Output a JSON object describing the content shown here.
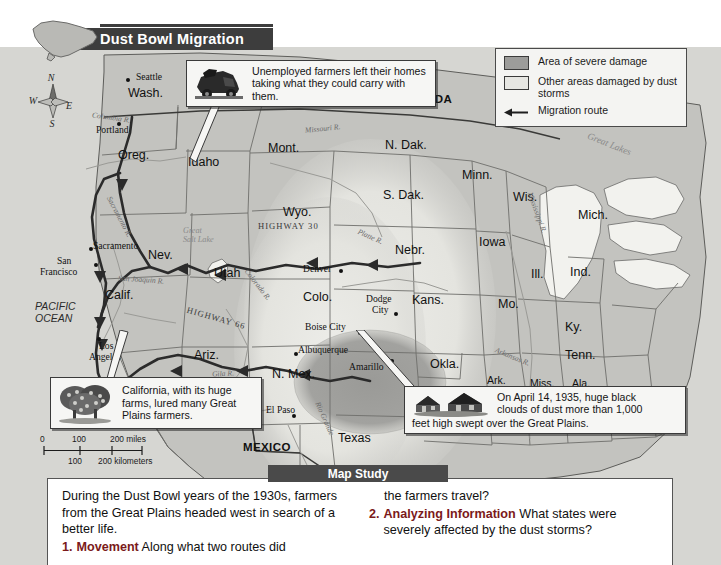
{
  "title": {
    "text": "Dust Bowl Migration",
    "icon": "usa-outline-icon"
  },
  "compass": {
    "north": "N",
    "east": "E",
    "south": "S",
    "west": "W"
  },
  "legend": {
    "items": [
      {
        "swatch": "severe",
        "label": "Area of severe damage"
      },
      {
        "swatch": "other",
        "label": "Other areas damaged by dust storms"
      },
      {
        "swatch": "arrow",
        "label": "Migration route"
      }
    ]
  },
  "callouts": [
    {
      "id": "farmers",
      "icon": "loaded-truck-icon",
      "text": "Unemployed farmers left their homes taking what they could carry with them."
    },
    {
      "id": "california",
      "icon": "orchard-trees-icon",
      "text": "California, with its huge farms, lured many Great Plains farmers."
    },
    {
      "id": "dust",
      "icon": "farm-houses-icon",
      "text_line1": "On April 14, 1935, huge black",
      "text_line2": "clouds of dust more than 1,000",
      "text_line3": "feet high swept over the Great Plains."
    }
  ],
  "scale": {
    "miles": "0        100       200 miles",
    "miles_zero": "0",
    "miles_100": "100",
    "miles_200": "200 miles",
    "km_100": "100",
    "km_200": "200 kilometers"
  },
  "map": {
    "countries": [
      {
        "name": "CANADA",
        "x": 400,
        "y": 93
      },
      {
        "name": "MEXICO",
        "x": 243,
        "y": 441
      }
    ],
    "ocean": {
      "line1": "PACIFIC",
      "line2": "OCEAN",
      "x": 35,
      "y": 300
    },
    "states": [
      {
        "name": "Wash.",
        "x": 128,
        "y": 86,
        "size": "state"
      },
      {
        "name": "Oreg.",
        "x": 118,
        "y": 148,
        "size": "state"
      },
      {
        "name": "Idaho",
        "x": 188,
        "y": 155,
        "size": "state"
      },
      {
        "name": "Mont.",
        "x": 268,
        "y": 141,
        "size": "state"
      },
      {
        "name": "N. Dak.",
        "x": 385,
        "y": 138,
        "size": "state"
      },
      {
        "name": "Minn.",
        "x": 462,
        "y": 168,
        "size": "state"
      },
      {
        "name": "Wis.",
        "x": 513,
        "y": 190,
        "size": "state"
      },
      {
        "name": "Mich.",
        "x": 578,
        "y": 208,
        "size": "state"
      },
      {
        "name": "S. Dak.",
        "x": 383,
        "y": 188,
        "size": "state"
      },
      {
        "name": "Wyo.",
        "x": 283,
        "y": 205,
        "size": "state"
      },
      {
        "name": "Nev.",
        "x": 148,
        "y": 248,
        "size": "state"
      },
      {
        "name": "Utah",
        "x": 214,
        "y": 266,
        "size": "state"
      },
      {
        "name": "Nebr.",
        "x": 395,
        "y": 243,
        "size": "state"
      },
      {
        "name": "Iowa",
        "x": 479,
        "y": 235,
        "size": "state"
      },
      {
        "name": "Ill.",
        "x": 531,
        "y": 267,
        "size": "state"
      },
      {
        "name": "Ind.",
        "x": 570,
        "y": 265,
        "size": "state"
      },
      {
        "name": "Colo.",
        "x": 303,
        "y": 290,
        "size": "state"
      },
      {
        "name": "Kans.",
        "x": 412,
        "y": 293,
        "size": "state"
      },
      {
        "name": "Mo.",
        "x": 498,
        "y": 297,
        "size": "state"
      },
      {
        "name": "Calif.",
        "x": 105,
        "y": 288,
        "size": "state"
      },
      {
        "name": "Ky.",
        "x": 565,
        "y": 320,
        "size": "state"
      },
      {
        "name": "Ariz.",
        "x": 194,
        "y": 348,
        "size": "state"
      },
      {
        "name": "N. Mex.",
        "x": 272,
        "y": 367,
        "size": "state"
      },
      {
        "name": "Okla.",
        "x": 430,
        "y": 357,
        "size": "state"
      },
      {
        "name": "Tenn.",
        "x": 565,
        "y": 348,
        "size": "state"
      },
      {
        "name": "Ark.",
        "x": 487,
        "y": 372,
        "size": "state"
      },
      {
        "name": "Miss.",
        "x": 530,
        "y": 375,
        "size": "state"
      },
      {
        "name": "Ala.",
        "x": 572,
        "y": 375,
        "size": "state"
      },
      {
        "name": "Texas",
        "x": 338,
        "y": 431,
        "size": "state"
      }
    ],
    "cities": [
      {
        "name": "Seattle",
        "x": 136,
        "y": 71,
        "dx": 126,
        "dy": 78
      },
      {
        "name": "Portland",
        "x": 96,
        "y": 124,
        "dx": 117,
        "dy": 122
      },
      {
        "name": "Sacramento",
        "x": 93,
        "y": 240,
        "dx": 89,
        "dy": 247
      },
      {
        "name": "San",
        "x": 57,
        "y": 255,
        "dx": 72,
        "dy": 269
      },
      {
        "name": "Francisco",
        "x": 44,
        "y": 266,
        "dx": 72,
        "dy": 269
      },
      {
        "name": "Los",
        "x": 99,
        "y": 340,
        "dx": 97,
        "dy": 337
      },
      {
        "name": "Angeles",
        "x": 89,
        "y": 351,
        "dx": 97,
        "dy": 337
      },
      {
        "name": "Denver",
        "x": 303,
        "y": 263,
        "dx": 339,
        "dy": 269
      },
      {
        "name": "Dodge",
        "x": 366,
        "y": 293,
        "dx": 394,
        "dy": 312
      },
      {
        "name": "City",
        "x": 372,
        "y": 304,
        "dx": 394,
        "dy": 312
      },
      {
        "name": "Boise City",
        "x": 305,
        "y": 321,
        "dx": 358,
        "dy": 331
      },
      {
        "name": "Albuquerque",
        "x": 298,
        "y": 344,
        "dx": 303,
        "dy": 352
      },
      {
        "name": "Amarillo",
        "x": 349,
        "y": 361,
        "dx": 368,
        "dy": 359
      },
      {
        "name": "El Paso",
        "x": 266,
        "y": 404,
        "dx": 292,
        "dy": 414
      }
    ],
    "rivers": [
      {
        "name": "Columbia R.",
        "x": 92,
        "y": 113,
        "rot": 8
      },
      {
        "name": "Missouri R.",
        "x": 305,
        "y": 124,
        "rot": -6
      },
      {
        "name": "Sacramento R.",
        "x": 97,
        "y": 212,
        "rot": 62
      },
      {
        "name": "San Joaquin R.",
        "x": 118,
        "y": 275,
        "rot": 4
      },
      {
        "name": "Platte R.",
        "x": 357,
        "y": 232,
        "rot": 24
      },
      {
        "name": "Colorado R.",
        "x": 239,
        "y": 280,
        "rot": 52
      },
      {
        "name": "Gila R.",
        "x": 212,
        "y": 369,
        "rot": -3
      },
      {
        "name": "Rio Grande",
        "x": 307,
        "y": 414,
        "rot": 66
      },
      {
        "name": "Mississippi R.",
        "x": 516,
        "y": 208,
        "rot": 70
      },
      {
        "name": "Arkansas R.",
        "x": 494,
        "y": 352,
        "rot": 22
      }
    ],
    "lakes": [
      {
        "line1": "Great",
        "line2": "Salt Lake",
        "x": 196,
        "y": 226
      },
      {
        "line1": "Great",
        "line2": "Lakes",
        "x": 591,
        "y": 140
      }
    ],
    "highways": [
      {
        "name": "HIGHWAY 30",
        "x": 258,
        "y": 221,
        "rot": 0
      },
      {
        "name": "HIGHWAY 66",
        "x": 186,
        "y": 313,
        "rot": 16
      }
    ]
  },
  "study": {
    "banner": "Map Study",
    "intro": "During the Dust Bowl years of the 1930s, farmers from the Great Plains headed west in search of a better life.",
    "questions": [
      {
        "number": "1.",
        "term": "Movement",
        "text": "Along what two routes did the farmers travel?"
      },
      {
        "number": "2.",
        "term": "Analyzing Information",
        "text": "What states were severely affected by the dust storms?"
      }
    ]
  },
  "colors": {
    "banner": "#3d3d3d",
    "study_banner": "#4a4a4a",
    "question_accent": "#7b1a1a",
    "land": "#c3c3bf",
    "severe": "#9c9c9a",
    "other_damage": "#e6e6e2",
    "water": "#f2f2ee",
    "route": "#2b2b2b"
  }
}
